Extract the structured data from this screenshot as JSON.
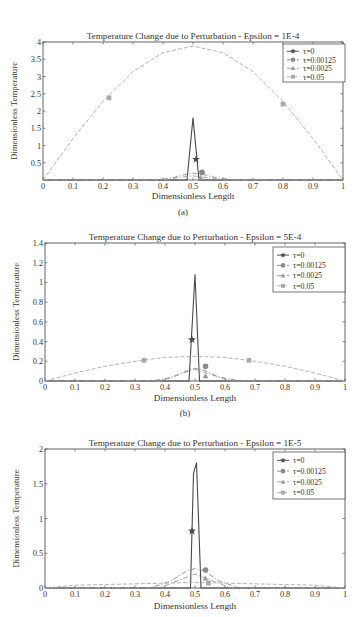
{
  "chart_data": [
    {
      "id": "a",
      "type": "line",
      "panel_label": "(a)",
      "title": "Temperature Change due to Perturbation - Epsilon = 1E-4",
      "xlabel": "Dimensionless Length",
      "ylabel": "Dimensionless Temperature",
      "xlim": [
        0,
        1
      ],
      "ylim": [
        0,
        4
      ],
      "xticks": [
        "0",
        "0.1",
        "0.2",
        "0.3",
        "0.4",
        "0.5",
        "0.6",
        "0.7",
        "0.8",
        "0.9",
        "1"
      ],
      "yticks": [
        "0.5",
        "1",
        "1.5",
        "2",
        "2.5",
        "3",
        "3.5",
        "4"
      ],
      "ytick_values": [
        0.5,
        1,
        1.5,
        2,
        2.5,
        3,
        3.5,
        4
      ],
      "legend": {
        "position": "upper right",
        "entries": [
          "τ=0",
          "τ=0.00125",
          "τ=0.0025",
          "τ=0.05"
        ]
      },
      "series": [
        {
          "name": "τ=0",
          "marker": "star",
          "style": "solid",
          "x": [
            0,
            0.48,
            0.5,
            0.52,
            1
          ],
          "y": [
            0,
            0,
            1.8,
            0,
            0
          ],
          "marker_points": [
            [
              0.51,
              0.6
            ]
          ]
        },
        {
          "name": "τ=0.00125",
          "marker": "circle",
          "style": "dashdot",
          "x": [
            0,
            0.35,
            0.42,
            0.47,
            0.5,
            0.53,
            0.58,
            0.65,
            1
          ],
          "y": [
            0,
            0,
            0.04,
            0.15,
            0.2,
            0.17,
            0.06,
            0,
            0
          ],
          "marker_points": [
            [
              0.53,
              0.22
            ]
          ]
        },
        {
          "name": "τ=0.0025",
          "marker": "triangle",
          "style": "dashdot",
          "x": [
            0,
            0.4,
            0.46,
            0.5,
            0.54,
            0.6,
            1
          ],
          "y": [
            0,
            0,
            0.08,
            0.12,
            0.08,
            0,
            0
          ],
          "marker_points": [
            [
              0.525,
              0.07
            ]
          ]
        },
        {
          "name": "τ=0.05",
          "marker": "square",
          "style": "dashed",
          "x": [
            0,
            0.1,
            0.2,
            0.3,
            0.4,
            0.5,
            0.6,
            0.7,
            0.8,
            0.9,
            1
          ],
          "y": [
            0,
            1.2,
            2.28,
            3.14,
            3.69,
            3.88,
            3.69,
            3.14,
            2.28,
            1.2,
            0
          ],
          "marker_points": [
            [
              0.22,
              2.38
            ],
            [
              0.8,
              2.2
            ]
          ]
        }
      ]
    },
    {
      "id": "b",
      "type": "line",
      "panel_label": "(b)",
      "title": "Temperature Change due to Perturbation - Epsilon = 5E-4",
      "xlabel": "Dimensionless Length",
      "ylabel": "Dimensionless Temperature",
      "xlim": [
        0,
        1
      ],
      "ylim": [
        0,
        1.4
      ],
      "xticks": [
        "0",
        "0.1",
        "0.2",
        "0.3",
        "0.4",
        "0.5",
        "0.6",
        "0.7",
        "0.8",
        "0.9",
        "1"
      ],
      "yticks": [
        "0",
        "0.2",
        "0.4",
        "0.6",
        "0.8",
        "1",
        "1.2",
        "1.4"
      ],
      "ytick_values": [
        0,
        0.2,
        0.4,
        0.6,
        0.8,
        1,
        1.2,
        1.4
      ],
      "legend": {
        "position": "upper right",
        "entries": [
          "τ=0",
          "τ=0.00125",
          "τ=0.0025",
          "τ=0.05"
        ]
      },
      "series": [
        {
          "name": "τ=0",
          "marker": "star",
          "style": "solid",
          "x": [
            0,
            0.48,
            0.5,
            0.515,
            1
          ],
          "y": [
            0,
            0,
            1.08,
            0,
            0
          ],
          "marker_points": [
            [
              0.49,
              0.42
            ]
          ]
        },
        {
          "name": "τ=0.00125",
          "marker": "circle",
          "style": "dashdot",
          "x": [
            0,
            0.35,
            0.42,
            0.47,
            0.5,
            0.53,
            0.58,
            0.65,
            1
          ],
          "y": [
            0,
            0,
            0.03,
            0.1,
            0.13,
            0.11,
            0.04,
            0,
            0
          ],
          "marker_points": [
            [
              0.535,
              0.15
            ]
          ]
        },
        {
          "name": "τ=0.0025",
          "marker": "triangle",
          "style": "dashdot",
          "x": [
            0,
            0.38,
            0.44,
            0.5,
            0.56,
            0.62,
            1
          ],
          "y": [
            0,
            0,
            0.06,
            0.12,
            0.06,
            0,
            0
          ],
          "marker_points": [
            [
              0.535,
              0.05
            ]
          ]
        },
        {
          "name": "τ=0.05",
          "marker": "square",
          "style": "dashed",
          "x": [
            0,
            0.1,
            0.2,
            0.3,
            0.4,
            0.5,
            0.6,
            0.7,
            0.8,
            0.9,
            1
          ],
          "y": [
            0,
            0.08,
            0.15,
            0.2,
            0.24,
            0.25,
            0.24,
            0.2,
            0.15,
            0.08,
            0
          ],
          "marker_points": [
            [
              0.33,
              0.21
            ],
            [
              0.68,
              0.21
            ]
          ]
        }
      ]
    },
    {
      "id": "c",
      "type": "line",
      "panel_label": "",
      "title": "Temperature Change due to Perturbation - Epsilon = 1E-5",
      "xlabel": "Dimensionless Length",
      "ylabel": "Dimensionless Temperature",
      "xlim": [
        0,
        1
      ],
      "ylim": [
        0,
        2
      ],
      "xticks": [
        "0",
        "0.1",
        "0.2",
        "0.3",
        "0.4",
        "0.5",
        "0.6",
        "0.7",
        "0.8",
        "0.9",
        "1"
      ],
      "yticks": [
        "0",
        "0.5",
        "1",
        "1.5",
        "2"
      ],
      "ytick_values": [
        0,
        0.5,
        1,
        1.5,
        2
      ],
      "legend": {
        "position": "upper right",
        "entries": [
          "τ=0",
          "τ=0.00125",
          "τ=0.0025",
          "τ=0.05"
        ]
      },
      "series": [
        {
          "name": "τ=0",
          "marker": "star",
          "style": "solid",
          "x": [
            0,
            0.485,
            0.495,
            0.505,
            0.52,
            1
          ],
          "y": [
            0,
            0,
            1.65,
            1.8,
            0,
            0
          ],
          "marker_points": [
            [
              0.49,
              0.82
            ]
          ]
        },
        {
          "name": "τ=0.00125",
          "marker": "circle",
          "style": "dashdot",
          "x": [
            0,
            0.35,
            0.42,
            0.47,
            0.5,
            0.53,
            0.58,
            0.65,
            1
          ],
          "y": [
            0,
            0,
            0.1,
            0.24,
            0.28,
            0.25,
            0.1,
            0,
            0
          ],
          "marker_points": [
            [
              0.535,
              0.26
            ]
          ]
        },
        {
          "name": "τ=0.0025",
          "marker": "triangle",
          "style": "dashdot",
          "x": [
            0,
            0.38,
            0.44,
            0.5,
            0.56,
            0.62,
            1
          ],
          "y": [
            0,
            0,
            0.1,
            0.2,
            0.1,
            0,
            0
          ],
          "marker_points": [
            [
              0.535,
              0.14
            ]
          ]
        },
        {
          "name": "τ=0.05",
          "marker": "square",
          "style": "dashed",
          "x": [
            0,
            0.1,
            0.3,
            0.5,
            0.7,
            0.9,
            1
          ],
          "y": [
            0,
            0.04,
            0.06,
            0.08,
            0.06,
            0.04,
            0
          ],
          "marker_points": [
            [
              0.545,
              0.07
            ]
          ]
        }
      ]
    }
  ],
  "figure": {
    "panels": [
      {
        "title": "Temperature Change due to Perturbation - Epsilon = 1E-4",
        "xlabel": "Dimensionless Length",
        "ylabel": "Dimensionless Temperature",
        "caption": "(a)"
      },
      {
        "title": "Temperature Change due to Perturbation - Epsilon = 5E-4",
        "xlabel": "Dimensionless Length",
        "ylabel": "Dimensionless Temperature",
        "caption": "(b)"
      },
      {
        "title": "Temperature Change due to Perturbation - Epsilon = 1E-5",
        "xlabel": "Dimensionless Length",
        "ylabel": "Dimensionless Temperature",
        "caption": ""
      }
    ],
    "colors": {
      "axis": "#555555",
      "tau0": "#4a4a4a",
      "tau00125": "#8a8a8a",
      "tau0025": "#9a9a9a",
      "tau005": "#aaaaaa"
    }
  }
}
